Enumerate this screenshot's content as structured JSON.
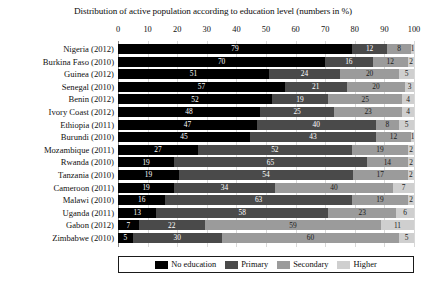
{
  "chart_data": {
    "type": "bar",
    "orientation": "horizontal",
    "stacked": true,
    "title": "Distribution of active population according to education level (numbers in %)",
    "xlabel": "",
    "ylabel": "",
    "xlim": [
      0,
      100
    ],
    "xticks": [
      0,
      10,
      20,
      30,
      40,
      50,
      60,
      70,
      80,
      90,
      100
    ],
    "grid": true,
    "legend_position": "bottom",
    "legend": [
      "No education",
      "Primary",
      "Secondary",
      "Higher"
    ],
    "colors": [
      "#000000",
      "#4a4a4a",
      "#9b9b9b",
      "#cfcfcf"
    ],
    "categories": [
      "Nigeria (2012)",
      "Burkina Faso (2010)",
      "Guinea (2012)",
      "Senegal (2010)",
      "Benin (2012)",
      "Ivory Coast (2012)",
      "Ethiopia (2011)",
      "Burundi (2010)",
      "Mozambique (2011)",
      "Rwanda (2010)",
      "Tanzania (2010)",
      "Cameroon (2011)",
      "Malawi (2010)",
      "Uganda (2011)",
      "Gabon (2012)",
      "Zimbabwe (2010)"
    ],
    "series": [
      {
        "name": "No education",
        "values": [
          79,
          70,
          51,
          57,
          52,
          48,
          47,
          45,
          27,
          19,
          19,
          19,
          16,
          13,
          7,
          5
        ]
      },
      {
        "name": "Primary",
        "values": [
          12,
          16,
          24,
          21,
          19,
          25,
          40,
          43,
          52,
          65,
          54,
          34,
          63,
          58,
          22,
          30
        ]
      },
      {
        "name": "Secondary",
        "values": [
          8,
          12,
          20,
          20,
          25,
          23,
          8,
          12,
          19,
          14,
          17,
          40,
          19,
          23,
          59,
          60
        ]
      },
      {
        "name": "Higher",
        "values": [
          1,
          2,
          5,
          3,
          4,
          4,
          5,
          1,
          2,
          2,
          2,
          7,
          2,
          6,
          11,
          5
        ]
      }
    ]
  }
}
